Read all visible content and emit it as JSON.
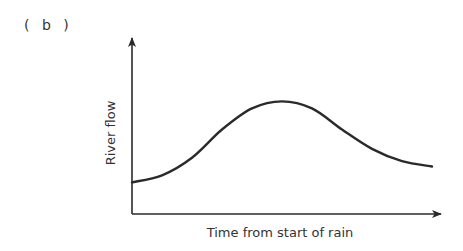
{
  "figure": {
    "panel_label": "( b )"
  },
  "chart_data": {
    "type": "line",
    "title": "",
    "panel": "(b)",
    "xlabel": "Time from start of rain",
    "ylabel": "River flow",
    "x_ticks": [],
    "y_ticks": [],
    "grid": false,
    "legend": null,
    "axes_style": "arrow-headed axes, no tick marks or numeric scale",
    "series": [
      {
        "name": "River flow (hydrograph)",
        "description": "Flow starts at a moderate base level, rises gradually to a broad peak near the middle of the time axis, then recedes gradually, ending above the starting level",
        "x": [
          0,
          0.1,
          0.2,
          0.3,
          0.4,
          0.5,
          0.6,
          0.7,
          0.8,
          0.9,
          1.0
        ],
        "values": [
          0.18,
          0.22,
          0.32,
          0.48,
          0.6,
          0.64,
          0.6,
          0.48,
          0.37,
          0.3,
          0.27
        ]
      }
    ],
    "xlim": [
      0,
      1
    ],
    "ylim": [
      0,
      1
    ],
    "color": "#2a2a2a"
  }
}
